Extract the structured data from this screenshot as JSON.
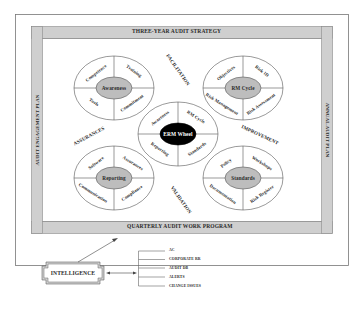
{
  "frame": {
    "top_band": "THREE-YEAR AUDIT STRATEGY",
    "bottom_band": "QUARTERLY AUDIT WORK PROGRAM",
    "left_band": "AUDIT ENGAGEMENT PLAN",
    "right_band": "ANNUAL AUDIT PLAN"
  },
  "flows": {
    "facilitation": "FACILITATION",
    "assurances": "ASSURANCES",
    "improvement": "IMPROVEMENT",
    "validation": "VALIDATION"
  },
  "wheels": {
    "awareness": {
      "center": "Awareness",
      "segments": [
        "Competence",
        "Training",
        "Tools",
        "Commitment"
      ]
    },
    "rm_cycle": {
      "center": "RM Cycle",
      "segments": [
        "Objectives",
        "Risk ID",
        "Risk Management",
        "Risk Assessment"
      ]
    },
    "erm": {
      "center": "ERM Wheel",
      "segments": [
        "Awareness",
        "RM Cycle",
        "Reporting",
        "Standards"
      ]
    },
    "reporting": {
      "center": "Reporting",
      "segments": [
        "Software",
        "Assurances",
        "Communication",
        "Compliance"
      ]
    },
    "standards": {
      "center": "Standards",
      "segments": [
        "Policy",
        "Workshops",
        "Documentation",
        "Risk Register"
      ]
    }
  },
  "intelligence": {
    "label": "INTELLIGENCE",
    "sources": [
      "AC",
      "CORPORATE RR",
      "AUDIT DB",
      "ALERTS",
      "CHANGE ISSUES"
    ]
  },
  "colors": {
    "band": "#cfcfcf",
    "band_border": "#8a8a8a",
    "wheel_center": "#bdbdbd",
    "erm_center": "#000000"
  }
}
